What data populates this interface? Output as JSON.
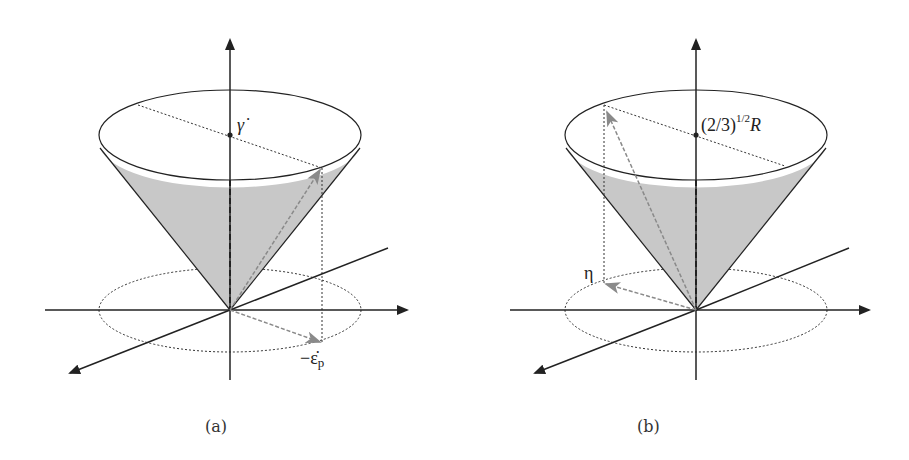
{
  "figure": {
    "panels": [
      {
        "id": "a",
        "caption": "(a)",
        "apex_label": "γ̇",
        "vector_label_main": "−ε̇",
        "vector_label_sub": "p"
      },
      {
        "id": "b",
        "caption": "(b)",
        "apex_label_base": "(2/3)",
        "apex_label_sup": "1/2",
        "apex_label_tail": "R",
        "vector_label": "η"
      }
    ],
    "colors": {
      "axis": "#222222",
      "cone_fill": "#c8c8c8",
      "vector": "#8a8a8a",
      "dotted": "#333333"
    }
  }
}
